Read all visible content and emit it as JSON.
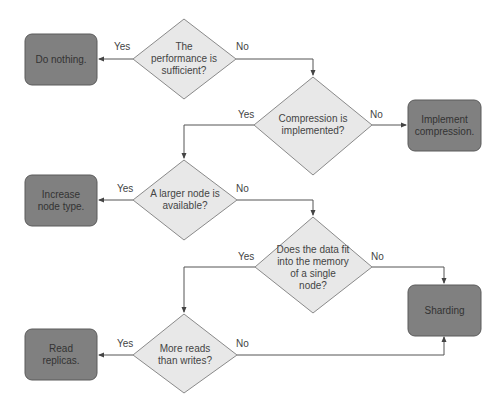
{
  "colors": {
    "decision_fill": "#e8e8e8",
    "decision_stroke": "#8a8a8a",
    "action_fill": "#808080",
    "action_stroke": "#5a5a5a",
    "line": "#555555"
  },
  "decisions": [
    {
      "id": "performance",
      "text": "The performance is sufficient?"
    },
    {
      "id": "compression",
      "text": "Compression is implemented?"
    },
    {
      "id": "larger-node",
      "text": "A larger node is available?"
    },
    {
      "id": "fits-memory",
      "text": "Does the data fit into the memory of a single node?"
    },
    {
      "id": "reads-writes",
      "text": "More reads than writes?"
    }
  ],
  "actions": [
    {
      "id": "do-nothing",
      "text": "Do nothing."
    },
    {
      "id": "implement-compression",
      "text": "Implement compression."
    },
    {
      "id": "increase-node",
      "text": "Increase node type."
    },
    {
      "id": "sharding",
      "text": "Sharding"
    },
    {
      "id": "read-replicas",
      "text": "Read replicas."
    }
  ],
  "edge_labels": {
    "yes": "Yes",
    "no": "No"
  }
}
